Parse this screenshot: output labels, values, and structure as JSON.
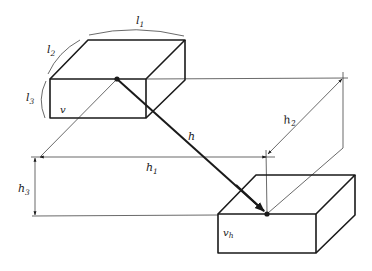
{
  "diagram": {
    "type": "geometric-construction",
    "colors": {
      "line": "#1a1a1a",
      "background": "#ffffff"
    },
    "labels": {
      "l1": {
        "main": "l",
        "sub": "1"
      },
      "l2": {
        "main": "l",
        "sub": "2"
      },
      "l3": {
        "main": "l",
        "sub": "3"
      },
      "v": {
        "main": "v"
      },
      "h": {
        "main": "h"
      },
      "h1": {
        "main": "h",
        "sub": "1"
      },
      "h2": {
        "main": "h",
        "sub": "2"
      },
      "h3": {
        "main": "h",
        "sub": "3"
      },
      "vh": {
        "main": "v",
        "sub": "h"
      }
    },
    "objects": [
      {
        "name": "upper-block",
        "label": "v",
        "dimensions": [
          "l1",
          "l2",
          "l3"
        ]
      },
      {
        "name": "lower-block",
        "label": "vh"
      }
    ],
    "dimensions": [
      {
        "name": "h",
        "meaning": "direct distance between block points"
      },
      {
        "name": "h1",
        "meaning": "horizontal component"
      },
      {
        "name": "h2",
        "meaning": "depth component"
      },
      {
        "name": "h3",
        "meaning": "vertical component"
      }
    ]
  }
}
